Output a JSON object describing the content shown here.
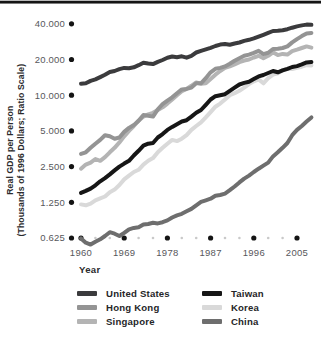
{
  "figure": {
    "y_axis_title_line1": "Real GDP per Person",
    "y_axis_title_line2": "(Thousands of 1996 Dollars; Ratio Scale)",
    "x_axis_title": "Year"
  },
  "chart_data": {
    "type": "line",
    "title": "",
    "xlabel": "Year",
    "ylabel": "Real GDP per Person (Thousands of 1996 Dollars; Ratio Scale)",
    "y_scale": "log (ratio scale, doubling per tick)",
    "ylim": [
      0.625,
      40
    ],
    "grid": false,
    "legend_position": "bottom, two columns",
    "axis_dot_color": "#141414",
    "minor_dot_color": "#c9c9c9",
    "x_tick_years": [
      1960,
      1969,
      1978,
      1987,
      1996,
      2005
    ],
    "x_tick_labels": [
      "1960",
      "1969",
      "1978",
      "1987",
      "1996",
      "2005"
    ],
    "x_minor_tick_years": [
      1963,
      1966,
      1972,
      1975,
      1981,
      1984,
      1990,
      1993,
      1999,
      2002
    ],
    "y_tick_values": [
      40,
      20,
      10,
      5,
      2.5,
      1.25,
      0.625
    ],
    "y_tick_labels": [
      "40.000",
      "20.000",
      "10.000",
      "5.000",
      "2.500",
      "1.250",
      "0.625"
    ],
    "x": [
      1960,
      1961,
      1962,
      1963,
      1964,
      1965,
      1966,
      1967,
      1968,
      1969,
      1970,
      1971,
      1972,
      1973,
      1974,
      1975,
      1976,
      1977,
      1978,
      1979,
      1980,
      1981,
      1982,
      1983,
      1984,
      1985,
      1986,
      1987,
      1988,
      1989,
      1990,
      1991,
      1992,
      1993,
      1994,
      1995,
      1996,
      1997,
      1998,
      1999,
      2000,
      2001,
      2002,
      2003,
      2004,
      2005,
      2006,
      2007,
      2008
    ],
    "series": [
      {
        "name": "United States",
        "color": "#3b3b3d",
        "values": [
          12.5,
          12.6,
          13.2,
          13.6,
          14.2,
          14.9,
          15.7,
          16.0,
          16.6,
          17.0,
          16.9,
          17.2,
          17.9,
          18.8,
          18.5,
          18.3,
          19.1,
          19.8,
          20.7,
          21.2,
          20.9,
          21.3,
          20.7,
          21.5,
          22.9,
          23.7,
          24.4,
          25.1,
          26.0,
          26.7,
          27.0,
          26.6,
          27.3,
          27.8,
          28.7,
          29.3,
          30.1,
          31.2,
          32.3,
          33.5,
          34.8,
          34.9,
          35.3,
          36.0,
          37.1,
          38.0,
          38.8,
          39.4,
          39.2
        ]
      },
      {
        "name": "Hong Kong",
        "color": "#949494",
        "values": [
          3.2,
          3.3,
          3.6,
          3.9,
          4.2,
          4.6,
          4.5,
          4.3,
          4.4,
          4.9,
          5.3,
          5.6,
          6.1,
          6.8,
          6.7,
          6.6,
          7.6,
          8.4,
          9.0,
          9.6,
          10.4,
          11.2,
          11.3,
          11.6,
          12.6,
          12.6,
          13.9,
          15.6,
          16.7,
          17.0,
          17.5,
          18.4,
          19.5,
          20.5,
          21.5,
          22.0,
          22.8,
          23.7,
          22.2,
          22.8,
          24.5,
          24.6,
          25.0,
          25.8,
          27.9,
          29.7,
          31.5,
          33.2,
          33.5
        ]
      },
      {
        "name": "Singapore",
        "color": "#b4b4b4",
        "values": [
          2.4,
          2.6,
          2.7,
          2.9,
          2.8,
          3.0,
          3.3,
          3.6,
          4.0,
          4.5,
          5.0,
          5.5,
          6.1,
          6.6,
          6.9,
          7.1,
          7.5,
          7.9,
          8.5,
          9.2,
          10.0,
          10.8,
          11.3,
          12.0,
          12.8,
          12.5,
          12.6,
          13.7,
          14.9,
          16.0,
          17.0,
          17.5,
          18.2,
          19.0,
          19.6,
          20.0,
          20.8,
          21.5,
          20.5,
          21.5,
          23.0,
          21.8,
          22.3,
          22.0,
          23.5,
          24.2,
          25.0,
          25.8,
          25.2
        ]
      },
      {
        "name": "Taiwan",
        "color": "#161616",
        "values": [
          1.5,
          1.56,
          1.63,
          1.74,
          1.88,
          2.0,
          2.15,
          2.32,
          2.5,
          2.65,
          2.8,
          3.1,
          3.4,
          3.75,
          3.9,
          3.95,
          4.4,
          4.7,
          5.1,
          5.4,
          5.7,
          6.0,
          6.15,
          6.6,
          7.1,
          7.5,
          8.3,
          9.2,
          9.8,
          10.0,
          10.2,
          10.9,
          11.6,
          12.3,
          12.7,
          13.0,
          13.7,
          14.4,
          14.8,
          15.4,
          16.0,
          15.6,
          16.2,
          16.7,
          17.3,
          17.6,
          18.2,
          18.9,
          19.0
        ]
      },
      {
        "name": "Korea",
        "color": "#d9d9d9",
        "values": [
          1.2,
          1.18,
          1.22,
          1.3,
          1.35,
          1.4,
          1.52,
          1.6,
          1.75,
          1.95,
          2.1,
          2.25,
          2.35,
          2.6,
          2.8,
          2.95,
          3.3,
          3.6,
          3.9,
          4.2,
          4.1,
          4.3,
          4.6,
          5.1,
          5.5,
          5.9,
          6.5,
          7.2,
          8.0,
          8.5,
          9.2,
          10.0,
          10.4,
          10.9,
          11.6,
          12.4,
          13.1,
          13.6,
          12.6,
          13.9,
          14.9,
          15.3,
          16.3,
          16.6,
          16.6,
          17.0,
          17.4,
          17.9,
          17.8
        ]
      },
      {
        "name": "China",
        "color": "#6e6e6e",
        "values": [
          0.62,
          0.57,
          0.55,
          0.58,
          0.61,
          0.65,
          0.7,
          0.68,
          0.65,
          0.69,
          0.74,
          0.76,
          0.77,
          0.81,
          0.82,
          0.84,
          0.83,
          0.85,
          0.88,
          0.93,
          0.97,
          1.0,
          1.05,
          1.1,
          1.18,
          1.26,
          1.3,
          1.34,
          1.42,
          1.44,
          1.48,
          1.58,
          1.7,
          1.84,
          1.98,
          2.1,
          2.25,
          2.4,
          2.55,
          2.7,
          3.05,
          3.3,
          3.6,
          3.95,
          4.6,
          5.1,
          5.5,
          6.0,
          6.5
        ]
      }
    ],
    "draw_order": [
      4,
      2,
      1,
      5,
      3,
      0
    ],
    "legend_columns": [
      [
        "United States",
        "Hong Kong",
        "Singapore"
      ],
      [
        "Taiwan",
        "Korea",
        "China"
      ]
    ]
  }
}
